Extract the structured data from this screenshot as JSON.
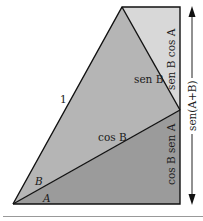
{
  "diagram": {
    "colors": {
      "light_region": "#d8d8d8",
      "mid_region": "#b5b5b5",
      "dark_region": "#9b9b9b",
      "stroke": "#111111",
      "arrow": "#222222",
      "separator": "#999999"
    },
    "labels": {
      "hypotenuse": "1",
      "sen_b": "sen B",
      "cos_b": "cos B",
      "angle_b": "B",
      "angle_a": "A",
      "sen_b_cos_a": "sen B cos A",
      "cos_b_sen_a": "cos B sen A",
      "sen_a_plus_b": "sen(A+B)"
    }
  }
}
